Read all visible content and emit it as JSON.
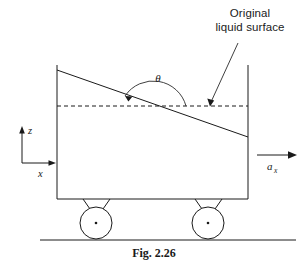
{
  "figure": {
    "caption": "Fig. 2.26",
    "callout_line1": "Original",
    "callout_line2": "liquid surface",
    "angle_symbol": "θ",
    "axis_z_label": "z",
    "axis_x_label": "x",
    "acceleration_label": "a",
    "acceleration_subscript": "x"
  },
  "diagram_data": {
    "type": "schematic",
    "subject": "Open rectangular tank of liquid on wheels undergoing constant horizontal acceleration",
    "elements": [
      {
        "name": "tank",
        "shape": "rectangle",
        "left_wall_x": 57,
        "right_wall_x": 248,
        "top_y": 65,
        "bottom_y": 199
      },
      {
        "name": "original-liquid-surface",
        "shape": "dashed-horizontal-line",
        "y": 106,
        "x_start": 57,
        "x_end": 248
      },
      {
        "name": "tilted-liquid-surface",
        "shape": "sloped-line",
        "x_start": 57,
        "y_start": 70,
        "x_end": 248,
        "y_end": 137
      },
      {
        "name": "angle-arc",
        "symbol": "θ",
        "vertex_x": 152,
        "vertex_y": 106,
        "description": "angle between original horizontal surface and tilted free surface"
      },
      {
        "name": "wheel-front",
        "shape": "circle",
        "cx": 96,
        "cy": 223,
        "r": 16
      },
      {
        "name": "wheel-rear",
        "shape": "circle",
        "cx": 208,
        "cy": 223,
        "r": 16
      },
      {
        "name": "ground-line",
        "shape": "horizontal-line",
        "y": 240,
        "x_start": 40,
        "x_end": 296
      },
      {
        "name": "acceleration-arrow",
        "direction": "right",
        "x_start": 257,
        "x_end": 297,
        "y": 155
      },
      {
        "name": "coordinate-axes",
        "origin_x": 22,
        "origin_y": 163,
        "z_direction": "up",
        "x_direction": "right"
      }
    ]
  }
}
